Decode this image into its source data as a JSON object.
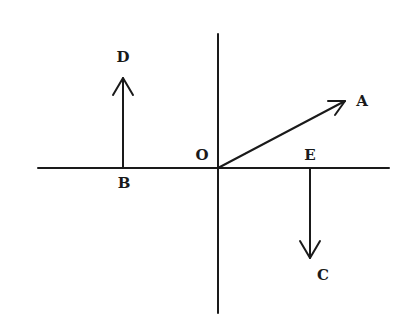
{
  "diagram": {
    "type": "vector-diagram",
    "colors": {
      "ink": "#1a1a1a",
      "background": "#ffffff"
    },
    "axes": {
      "horizontal": {
        "x1": 38,
        "y1": 168,
        "x2": 389,
        "y2": 168
      },
      "vertical": {
        "x1": 218,
        "y1": 34,
        "x2": 218,
        "y2": 313
      }
    },
    "points": {
      "O": {
        "label": "O",
        "x": 218,
        "y": 168
      },
      "A": {
        "label": "A",
        "x": 345,
        "y": 101
      },
      "B": {
        "label": "B",
        "x": 123,
        "y": 168
      },
      "C": {
        "label": "C",
        "x": 310,
        "y": 258
      },
      "D": {
        "label": "D",
        "x": 123,
        "y": 78
      },
      "E": {
        "label": "E",
        "x": 310,
        "y": 168
      }
    },
    "vectors": [
      {
        "name": "OA",
        "from": "O",
        "to": "A"
      },
      {
        "name": "BD",
        "from": "B",
        "to": "D"
      },
      {
        "name": "EC",
        "from": "E",
        "to": "C"
      }
    ],
    "labels": {
      "O": "O",
      "A": "A",
      "B": "B",
      "C": "C",
      "D": "D",
      "E": "E"
    }
  }
}
